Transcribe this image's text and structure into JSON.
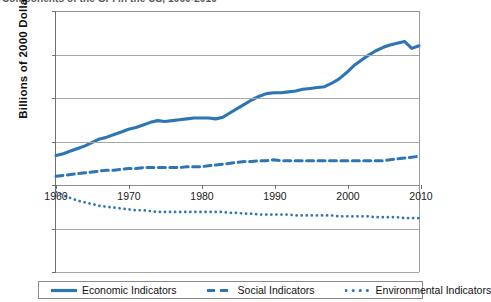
{
  "title": {
    "text": "Components of the GPI in the US, 1960-2010",
    "clipped": true
  },
  "axes": {
    "ylabel": "Billions of 2000 Dollars",
    "xlabel": "",
    "yticks": [
      200,
      150,
      100,
      50,
      0,
      -50,
      -100
    ],
    "ytick_labels": [
      "200",
      "150",
      "100",
      "50",
      "0",
      "-50",
      "-100"
    ],
    "xticks": [
      1960,
      1970,
      1980,
      1990,
      2000,
      2010
    ],
    "xtick_labels": [
      "1960",
      "1970",
      "1980",
      "1990",
      "2000",
      "2010"
    ]
  },
  "legend": {
    "position": "bottom",
    "items": [
      {
        "label": "Economic Indicators",
        "style": "solid",
        "color": "#2E75B6"
      },
      {
        "label": "Social Indicators",
        "style": "dashed",
        "color": "#2E75B6"
      },
      {
        "label": "Environmental Indicators",
        "style": "dotted",
        "color": "#2E75B6"
      }
    ]
  },
  "colors": {
    "series": "#2E75B6",
    "axis": "#6f6f6f",
    "grid": "#a8a8a8",
    "text": "#1a1a1a",
    "background": "#ffffff"
  },
  "chart_data": {
    "type": "line",
    "title": "Components of the GPI in the US, 1960-2010",
    "xlabel": "",
    "ylabel": "Billions of 2000 Dollars",
    "xlim": [
      1960,
      2010
    ],
    "ylim": [
      -100,
      200
    ],
    "grid": true,
    "legend_position": "bottom",
    "x": [
      1960,
      1961,
      1962,
      1963,
      1964,
      1965,
      1966,
      1967,
      1968,
      1969,
      1970,
      1971,
      1972,
      1973,
      1974,
      1975,
      1976,
      1977,
      1978,
      1979,
      1980,
      1981,
      1982,
      1983,
      1984,
      1985,
      1986,
      1987,
      1988,
      1989,
      1990,
      1991,
      1992,
      1993,
      1994,
      1995,
      1996,
      1997,
      1998,
      1999,
      2000,
      2001,
      2002,
      2003,
      2004,
      2005,
      2006,
      2007,
      2008,
      2009,
      2010
    ],
    "series": [
      {
        "name": "Economic Indicators",
        "style": "solid",
        "color": "#2E75B6",
        "values": [
          34,
          36,
          39,
          42,
          45,
          49,
          53,
          55,
          58,
          61,
          64,
          66,
          69,
          72,
          74,
          73,
          74,
          75,
          76,
          77,
          77,
          77,
          76,
          78,
          83,
          88,
          93,
          98,
          102,
          105,
          106,
          106,
          107,
          108,
          110,
          111,
          112,
          113,
          117,
          122,
          129,
          137,
          143,
          149,
          154,
          158,
          161,
          163,
          165,
          157,
          160
        ]
      },
      {
        "name": "Social Indicators",
        "style": "dashed",
        "color": "#2E75B6",
        "values": [
          10,
          11,
          12,
          13,
          14,
          15,
          16,
          17,
          17,
          18,
          19,
          19,
          20,
          20,
          20,
          20,
          20,
          20,
          21,
          21,
          21,
          22,
          23,
          24,
          25,
          26,
          27,
          27,
          28,
          28,
          29,
          28,
          28,
          28,
          28,
          28,
          28,
          28,
          28,
          28,
          28,
          28,
          28,
          28,
          28,
          28,
          29,
          30,
          31,
          32,
          33
        ]
      },
      {
        "name": "Environmental Indicators",
        "style": "dotted",
        "color": "#2E75B6",
        "values": [
          -8,
          -12,
          -15,
          -18,
          -20,
          -22,
          -24,
          -25,
          -26,
          -27,
          -28,
          -29,
          -29,
          -30,
          -31,
          -31,
          -31,
          -31,
          -31,
          -31,
          -31,
          -31,
          -31,
          -31,
          -32,
          -32,
          -33,
          -33,
          -34,
          -34,
          -34,
          -34,
          -34,
          -35,
          -35,
          -35,
          -35,
          -35,
          -35,
          -36,
          -36,
          -36,
          -36,
          -36,
          -37,
          -37,
          -37,
          -37,
          -38,
          -38,
          -38
        ]
      }
    ]
  }
}
